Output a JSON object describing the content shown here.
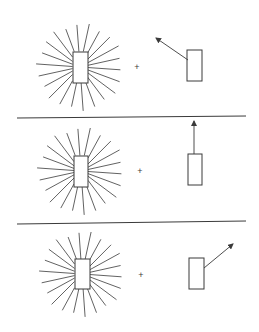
{
  "diagram": {
    "title": "",
    "colors": {
      "ink": "#3a3a3a",
      "background": "#ffffff"
    },
    "panels": [
      {
        "id": "panel-1",
        "source": {
          "center": [
            80,
            67
          ],
          "rect": [
            73,
            52,
            15,
            31
          ],
          "ray_count": 22,
          "ray_radius": 44
        },
        "operator": {
          "symbol": "+",
          "pos": [
            137,
            67
          ]
        },
        "target": {
          "rect": [
            187,
            50,
            15,
            31
          ],
          "arrow": {
            "from": [
              188,
              60
            ],
            "to": [
              156,
              38
            ]
          },
          "direction": "up-left"
        }
      },
      {
        "id": "panel-2",
        "source": {
          "center": [
            81,
            171
          ],
          "rect": [
            74,
            156,
            14,
            31
          ],
          "ray_count": 22,
          "ray_radius": 44
        },
        "operator": {
          "symbol": "+",
          "pos": [
            140,
            171
          ]
        },
        "target": {
          "rect": [
            188,
            154,
            14,
            31
          ],
          "arrow": {
            "from": [
              194,
              154
            ],
            "to": [
              194,
              121
            ]
          },
          "direction": "up"
        }
      },
      {
        "id": "panel-3",
        "source": {
          "center": [
            82,
            274
          ],
          "rect": [
            75,
            259,
            15,
            30
          ],
          "ray_count": 22,
          "ray_radius": 43
        },
        "operator": {
          "symbol": "+",
          "pos": [
            141,
            275
          ]
        },
        "target": {
          "rect": [
            189,
            258,
            15,
            31
          ],
          "arrow": {
            "from": [
              204,
              268
            ],
            "to": [
              233,
              244
            ]
          },
          "direction": "up-right"
        }
      }
    ],
    "dividers": [
      {
        "from": [
          17,
          118
        ],
        "to": [
          246,
          116
        ]
      },
      {
        "from": [
          17,
          224
        ],
        "to": [
          246,
          221
        ]
      }
    ]
  }
}
